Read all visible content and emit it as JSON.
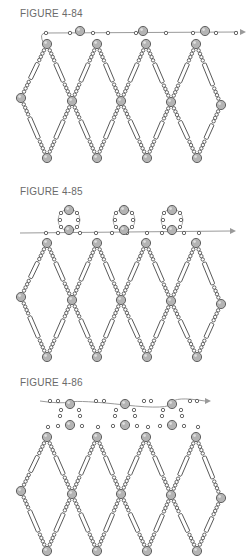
{
  "figures": [
    {
      "label": "FIGURE 4-84",
      "top": 0,
      "label_y": 8,
      "variant": "thread-top"
    },
    {
      "label": "FIGURE 4-85",
      "top": 183,
      "label_y": 5,
      "variant": "picots"
    },
    {
      "label": "FIGURE 4-86",
      "top": 375,
      "label_y": 5,
      "variant": "rings"
    }
  ],
  "colors": {
    "bead_fill": "#b4b4b4",
    "bead_stroke": "#555555",
    "seed_stroke": "#444444",
    "thread": "#9a9a9a",
    "label": "#6a6a6a"
  }
}
